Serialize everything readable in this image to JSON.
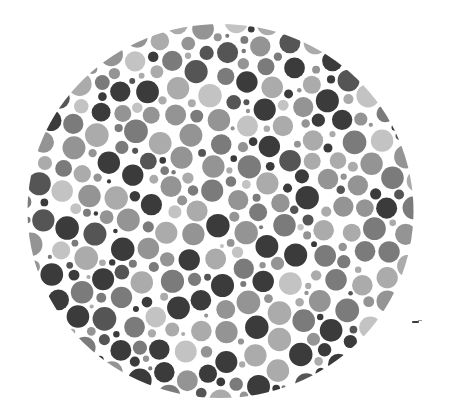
{
  "image": {
    "subject": "Ishihara-style color vision test plate (grayscale)",
    "width": 453,
    "height": 418,
    "background": "#ffffff"
  },
  "plate": {
    "center_x": 220.5,
    "center_y": 211,
    "radius_x": 193,
    "radius_y": 187,
    "dot_gap": 1.6,
    "radius_sizes": [
      2.2,
      3.2,
      4.2,
      5.4,
      7.0,
      9.0,
      11.0
    ],
    "radius_weights": [
      4,
      6,
      7,
      7,
      6,
      5,
      3
    ],
    "tones": [
      {
        "name": "dark",
        "hex": "#3b3b3b",
        "weight": 26
      },
      {
        "name": "dark-mid",
        "hex": "#555555",
        "weight": 10
      },
      {
        "name": "mid",
        "hex": "#7b7b7b",
        "weight": 22
      },
      {
        "name": "mid-light",
        "hex": "#949494",
        "weight": 18
      },
      {
        "name": "light",
        "hex": "#ababab",
        "weight": 16
      },
      {
        "name": "very-light",
        "hex": "#c3c3c3",
        "weight": 8
      }
    ],
    "seed": 20240611,
    "attempts": 26000
  },
  "margin_mark": {
    "x": 412,
    "y": 321,
    "color": "#3a3a3a"
  }
}
